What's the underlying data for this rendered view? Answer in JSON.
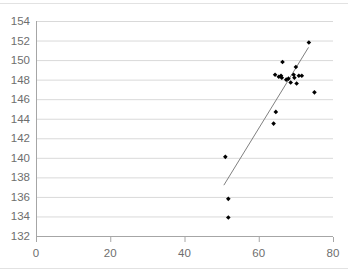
{
  "chart_data": {
    "type": "scatter",
    "title": "",
    "xlabel": "",
    "ylabel": "",
    "xlim": [
      0,
      80
    ],
    "ylim": [
      132,
      154
    ],
    "xticks": [
      0,
      20,
      40,
      60,
      80
    ],
    "yticks": [
      132,
      134,
      136,
      138,
      140,
      142,
      144,
      146,
      148,
      150,
      152,
      154
    ],
    "grid": "horizontal",
    "legend": "none",
    "marker": "diamond",
    "marker_color": "#000000",
    "grid_color": "#d9d9d9",
    "axis_color": "#a6a6a6",
    "tick_label_color": "#6e6e6e",
    "trendline_color": "#808080",
    "points": [
      {
        "x": 51.8,
        "y": 133.9
      },
      {
        "x": 51.8,
        "y": 135.8
      },
      {
        "x": 51.0,
        "y": 140.1
      },
      {
        "x": 64.0,
        "y": 143.5
      },
      {
        "x": 64.6,
        "y": 144.7
      },
      {
        "x": 64.4,
        "y": 148.5
      },
      {
        "x": 65.4,
        "y": 148.3
      },
      {
        "x": 66.0,
        "y": 148.4
      },
      {
        "x": 66.2,
        "y": 148.2
      },
      {
        "x": 66.4,
        "y": 149.8
      },
      {
        "x": 67.4,
        "y": 148.0
      },
      {
        "x": 68.0,
        "y": 148.1
      },
      {
        "x": 68.6,
        "y": 147.7
      },
      {
        "x": 69.4,
        "y": 148.5
      },
      {
        "x": 69.6,
        "y": 148.2
      },
      {
        "x": 70.0,
        "y": 149.3
      },
      {
        "x": 70.2,
        "y": 147.6
      },
      {
        "x": 70.8,
        "y": 148.4
      },
      {
        "x": 71.6,
        "y": 148.4
      },
      {
        "x": 73.5,
        "y": 151.8
      },
      {
        "x": 75.0,
        "y": 146.7
      }
    ],
    "trendline": {
      "x_start": 50.6,
      "y_start": 137.2,
      "x_end": 73.4,
      "y_end": 151.3
    }
  }
}
